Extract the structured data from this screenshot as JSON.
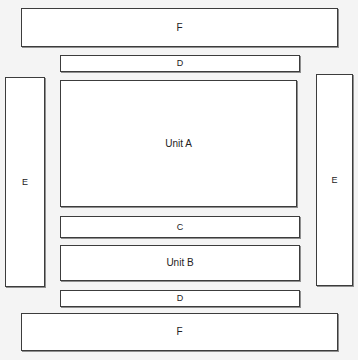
{
  "diagram": {
    "background_color": "#f4f4f4",
    "box_fill_color": "#ffffff",
    "box_border_color": "#3c3c3c",
    "label_color": "#222222",
    "boxes": [
      {
        "id": "f-top",
        "label": "F",
        "role": "outer-band-top"
      },
      {
        "id": "d-top",
        "label": "D",
        "role": "inner-band-top"
      },
      {
        "id": "e-left",
        "label": "E",
        "role": "side-column-left"
      },
      {
        "id": "e-right",
        "label": "E",
        "role": "side-column-right"
      },
      {
        "id": "unit-a",
        "label": "Unit A",
        "role": "main-unit"
      },
      {
        "id": "c",
        "label": "C",
        "role": "inner-band-middle"
      },
      {
        "id": "unit-b",
        "label": "Unit B",
        "role": "secondary-unit"
      },
      {
        "id": "d-bottom",
        "label": "D",
        "role": "inner-band-bottom"
      },
      {
        "id": "f-bottom",
        "label": "F",
        "role": "outer-band-bottom"
      }
    ]
  }
}
